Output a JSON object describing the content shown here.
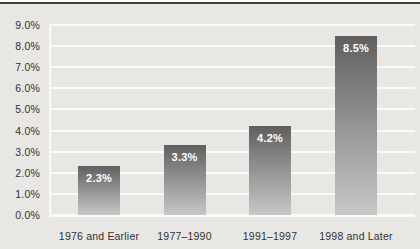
{
  "chart_data": {
    "type": "bar",
    "title": "",
    "categories": [
      "1976 and Earlier",
      "1977–1990",
      "1991–1997",
      "1998 and Later"
    ],
    "values": [
      2.3,
      3.3,
      4.2,
      8.5
    ],
    "bar_labels": [
      "2.3%",
      "3.3%",
      "4.2%",
      "8.5%"
    ],
    "xlabel": "",
    "ylabel": "",
    "ylim": [
      0,
      9
    ],
    "ytick_step": 1.0,
    "ytick_labels": [
      "0.0%",
      "1.0%",
      "2.0%",
      "3.0%",
      "4.0%",
      "5.0%",
      "6.0%",
      "7.0%",
      "8.0%",
      "9.0%"
    ],
    "grid": true,
    "gridline_orientation": "horizontal",
    "legend": "none"
  },
  "style": {
    "background": "#e8e7e4",
    "top_strip": "#ffffff",
    "top_rule": "#404040",
    "gridline": "#fafaf8",
    "axis_line": "#fafaf8",
    "axis_text": "#323232",
    "bar_gradient_top": "#5f5f5f",
    "bar_gradient_mid": "#949494",
    "bar_gradient_bottom": "#c7c7c7",
    "bar_value_text": "#ffffff"
  }
}
